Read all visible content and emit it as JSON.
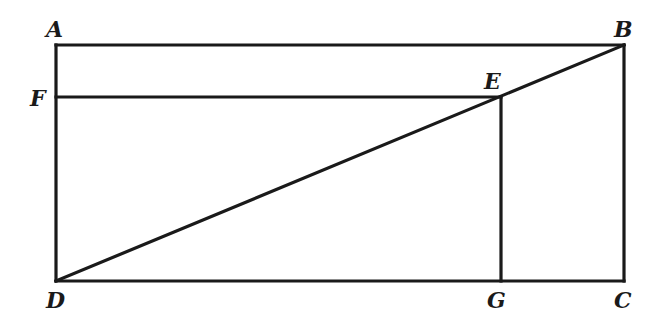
{
  "diagram": {
    "type": "geometry",
    "points": [
      {
        "id": "A",
        "label": "A"
      },
      {
        "id": "B",
        "label": "B"
      },
      {
        "id": "C",
        "label": "C"
      },
      {
        "id": "D",
        "label": "D"
      },
      {
        "id": "E",
        "label": "E"
      },
      {
        "id": "F",
        "label": "F"
      },
      {
        "id": "G",
        "label": "G"
      }
    ],
    "segments": [
      {
        "from": "A",
        "to": "B"
      },
      {
        "from": "B",
        "to": "C"
      },
      {
        "from": "C",
        "to": "D"
      },
      {
        "from": "D",
        "to": "A"
      },
      {
        "from": "D",
        "to": "B"
      },
      {
        "from": "F",
        "to": "E"
      },
      {
        "from": "E",
        "to": "G"
      }
    ]
  }
}
